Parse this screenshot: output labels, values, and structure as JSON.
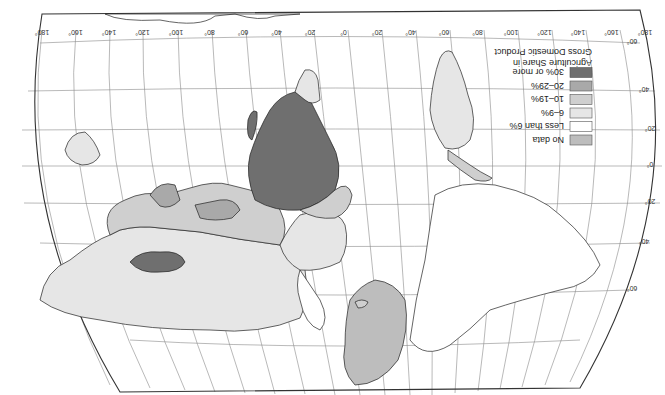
{
  "map": {
    "orientation": "rotated 180 degrees (south up)",
    "legend": {
      "title_line1": "Agriculture Share in",
      "title_line2": "Gross Domestic Product",
      "items": [
        {
          "label": "30% or more",
          "color": "#6f6f6f"
        },
        {
          "label": "20–29%",
          "color": "#a9a9a9"
        },
        {
          "label": "10–19%",
          "color": "#cfcfcf"
        },
        {
          "label": "6–9%",
          "color": "#e6e6e6"
        },
        {
          "label": "Less than 6%",
          "color": "#ffffff"
        },
        {
          "label": "No data",
          "color": "#bdbdbd"
        }
      ]
    },
    "longitude_labels": [
      "180°",
      "160°",
      "140°",
      "120°",
      "100°",
      "80°",
      "60°",
      "40°",
      "20°",
      "0°",
      "20°",
      "40°",
      "60°",
      "80°",
      "100°",
      "120°",
      "140°",
      "160°",
      "180°"
    ],
    "latitude_labels": [
      "60°",
      "40°",
      "20°",
      "0°",
      "20°",
      "40°",
      "60°"
    ],
    "colors": {
      "ocean": "#ffffff",
      "graticule": "#8a8a8a",
      "outline": "#222222"
    }
  }
}
